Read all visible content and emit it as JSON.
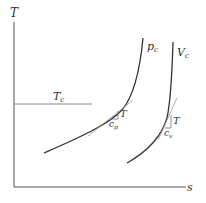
{
  "diagram": {
    "type": "T-s diagram",
    "axes": {
      "y_label": "T",
      "x_label": "s"
    },
    "critical_temperature": {
      "label": "T",
      "subscript": "c"
    },
    "curves": [
      {
        "name": "constant pressure",
        "label": "p",
        "subscript": "c",
        "slope_triangle": {
          "rise": "T",
          "run": "c",
          "run_subscript": "p"
        }
      },
      {
        "name": "constant volume",
        "label": "V",
        "subscript": "c",
        "slope_triangle": {
          "rise": "T",
          "run": "c",
          "run_subscript": "v"
        }
      }
    ],
    "colors": {
      "axis": "#555555",
      "curve": "#333333",
      "tangent": "#999999",
      "isotherm": "#888888"
    }
  }
}
